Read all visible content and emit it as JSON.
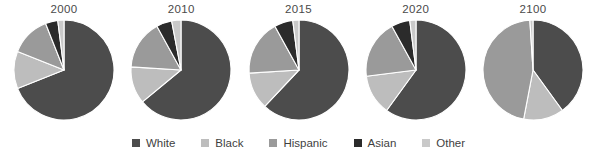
{
  "chart_data": {
    "type": "pie",
    "title": "",
    "subtitle": "",
    "xlabel": "",
    "ylabel": "",
    "grid": false,
    "legend_position": "bottom",
    "categories": [
      "White",
      "Black",
      "Hispanic",
      "Asian",
      "Other"
    ],
    "colors": [
      "#4c4c4c",
      "#bdbdbd",
      "#9a9a9a",
      "#2b2b2b",
      "#c9c9c9"
    ],
    "panels": [
      {
        "title": "2000",
        "values": [
          69,
          12,
          13,
          4,
          2
        ],
        "slices": [
          {
            "name": "White",
            "value": 69,
            "color": "#4c4c4c"
          },
          {
            "name": "Black",
            "value": 12,
            "color": "#bdbdbd"
          },
          {
            "name": "Hispanic",
            "value": 13,
            "color": "#9a9a9a"
          },
          {
            "name": "Asian",
            "value": 4,
            "color": "#2b2b2b"
          },
          {
            "name": "Other",
            "value": 2,
            "color": "#c9c9c9"
          }
        ]
      },
      {
        "title": "2010",
        "values": [
          64,
          12,
          16,
          5,
          3
        ],
        "slices": [
          {
            "name": "White",
            "value": 64,
            "color": "#4c4c4c"
          },
          {
            "name": "Black",
            "value": 12,
            "color": "#bdbdbd"
          },
          {
            "name": "Hispanic",
            "value": 16,
            "color": "#9a9a9a"
          },
          {
            "name": "Asian",
            "value": 5,
            "color": "#2b2b2b"
          },
          {
            "name": "Other",
            "value": 3,
            "color": "#c9c9c9"
          }
        ]
      },
      {
        "title": "2015",
        "values": [
          62,
          12,
          18,
          6,
          2
        ],
        "slices": [
          {
            "name": "White",
            "value": 62,
            "color": "#4c4c4c"
          },
          {
            "name": "Black",
            "value": 12,
            "color": "#bdbdbd"
          },
          {
            "name": "Hispanic",
            "value": 18,
            "color": "#9a9a9a"
          },
          {
            "name": "Asian",
            "value": 6,
            "color": "#2b2b2b"
          },
          {
            "name": "Other",
            "value": 2,
            "color": "#c9c9c9"
          }
        ]
      },
      {
        "title": "2020",
        "values": [
          60,
          13,
          19,
          6,
          2
        ],
        "slices": [
          {
            "name": "White",
            "value": 60,
            "color": "#4c4c4c"
          },
          {
            "name": "Black",
            "value": 13,
            "color": "#bdbdbd"
          },
          {
            "name": "Hispanic",
            "value": 19,
            "color": "#9a9a9a"
          },
          {
            "name": "Asian",
            "value": 6,
            "color": "#2b2b2b"
          },
          {
            "name": "Other",
            "value": 2,
            "color": "#c9c9c9"
          }
        ]
      },
      {
        "title": "2100",
        "values": [
          40,
          13,
          46,
          0,
          1
        ],
        "slices": [
          {
            "name": "White",
            "value": 40,
            "color": "#4c4c4c"
          },
          {
            "name": "Black",
            "value": 13,
            "color": "#bdbdbd"
          },
          {
            "name": "Hispanic",
            "value": 46,
            "color": "#9a9a9a"
          },
          {
            "name": "Asian",
            "value": 0,
            "color": "#2b2b2b"
          },
          {
            "name": "Other",
            "value": 1,
            "color": "#c9c9c9"
          }
        ]
      }
    ]
  },
  "legend": {
    "items": [
      {
        "label": "White",
        "color": "#4c4c4c"
      },
      {
        "label": "Black",
        "color": "#bdbdbd"
      },
      {
        "label": "Hispanic",
        "color": "#9a9a9a"
      },
      {
        "label": "Asian",
        "color": "#2b2b2b"
      },
      {
        "label": "Other",
        "color": "#c9c9c9"
      }
    ]
  },
  "style": {
    "background": "#ffffff",
    "title_color": "#4a4a4a",
    "legend_text_color": "#3f3f3f",
    "slice_stroke": "#ffffff"
  }
}
